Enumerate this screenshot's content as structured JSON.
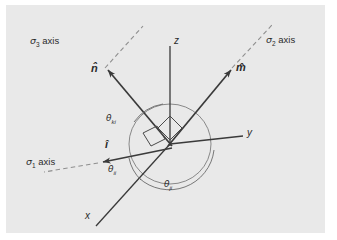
{
  "figure": {
    "background_color": "#e9e9e9",
    "page_color": "#ffffff",
    "line_color": "#3a3a3a",
    "dash_color": "#8a8a8a",
    "arc_color": "#6a6a6a"
  },
  "axes": [
    {
      "name": "z-axis",
      "label": "z"
    },
    {
      "name": "y-axis",
      "label": "y"
    },
    {
      "name": "x-axis",
      "label": "x"
    }
  ],
  "principal_axes": [
    {
      "name": "sigma-3-axis",
      "sigma": "σ",
      "index": "3",
      "suffix": " axis",
      "style": "dashed"
    },
    {
      "name": "sigma-2-axis",
      "sigma": "σ",
      "index": "2",
      "suffix": " axis",
      "style": "dashed"
    },
    {
      "name": "sigma-1-axis",
      "sigma": "σ",
      "index": "1",
      "suffix": " axis",
      "style": "dashed"
    }
  ],
  "unit_vectors": [
    {
      "name": "n-hat-vector",
      "label": "n̂"
    },
    {
      "name": "m-hat-vector",
      "label": "m̂"
    },
    {
      "name": "i-hat-vector",
      "label": "î"
    }
  ],
  "angles": [
    {
      "name": "theta-ki",
      "theta": "θ",
      "subscript": "ki"
    },
    {
      "name": "theta-ii",
      "theta": "θ",
      "subscript": "ii"
    },
    {
      "name": "theta-ji",
      "theta": "θ",
      "subscript": "ji"
    }
  ]
}
